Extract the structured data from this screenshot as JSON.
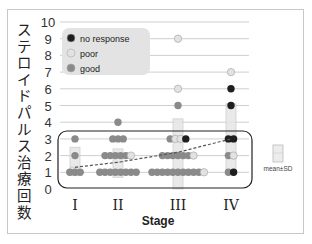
{
  "chart_data": {
    "type": "scatter",
    "title": "",
    "xlabel": "Stage",
    "ylabel": "ステロイドパルス治療回数",
    "categories": [
      "I",
      "II",
      "III",
      "IV"
    ],
    "ylim": [
      0,
      10
    ],
    "yticks": [
      0,
      1,
      2,
      3,
      4,
      5,
      6,
      7,
      8,
      9,
      10
    ],
    "grid": true,
    "legend": {
      "position": "upper-left",
      "entries": [
        {
          "label": "no response",
          "color": "#1e1e1e"
        },
        {
          "label": "poor",
          "color": "#e2e2e2"
        },
        {
          "label": "good",
          "color": "#8a8a8a"
        }
      ]
    },
    "secondary_legend": {
      "label": "mean±SD",
      "symbol": "light box"
    },
    "series": [
      {
        "name": "good",
        "points": [
          {
            "stage": "I",
            "y": 3
          },
          {
            "stage": "I",
            "y": 2
          },
          {
            "stage": "I",
            "y": 1
          },
          {
            "stage": "I",
            "y": 1
          },
          {
            "stage": "I",
            "y": 1
          },
          {
            "stage": "II",
            "y": 4
          },
          {
            "stage": "II",
            "y": 3
          },
          {
            "stage": "II",
            "y": 3
          },
          {
            "stage": "II",
            "y": 3
          },
          {
            "stage": "II",
            "y": 2
          },
          {
            "stage": "II",
            "y": 2
          },
          {
            "stage": "II",
            "y": 2
          },
          {
            "stage": "II",
            "y": 2
          },
          {
            "stage": "II",
            "y": 2
          },
          {
            "stage": "II",
            "y": 1
          },
          {
            "stage": "II",
            "y": 1
          },
          {
            "stage": "II",
            "y": 1
          },
          {
            "stage": "II",
            "y": 1
          },
          {
            "stage": "II",
            "y": 1
          },
          {
            "stage": "II",
            "y": 1
          },
          {
            "stage": "II",
            "y": 1
          },
          {
            "stage": "II",
            "y": 1
          },
          {
            "stage": "III",
            "y": 5
          },
          {
            "stage": "III",
            "y": 3
          },
          {
            "stage": "III",
            "y": 2
          },
          {
            "stage": "III",
            "y": 2
          },
          {
            "stage": "III",
            "y": 2
          },
          {
            "stage": "III",
            "y": 2
          },
          {
            "stage": "III",
            "y": 2
          },
          {
            "stage": "III",
            "y": 2
          },
          {
            "stage": "III",
            "y": 1
          },
          {
            "stage": "III",
            "y": 1
          },
          {
            "stage": "III",
            "y": 1
          },
          {
            "stage": "III",
            "y": 1
          },
          {
            "stage": "III",
            "y": 1
          },
          {
            "stage": "III",
            "y": 1
          },
          {
            "stage": "III",
            "y": 1
          },
          {
            "stage": "III",
            "y": 1
          },
          {
            "stage": "III",
            "y": 1
          },
          {
            "stage": "III",
            "y": 1
          },
          {
            "stage": "IV",
            "y": 2
          },
          {
            "stage": "IV",
            "y": 1
          }
        ]
      },
      {
        "name": "poor",
        "points": [
          {
            "stage": "III",
            "y": 9
          },
          {
            "stage": "III",
            "y": 6
          },
          {
            "stage": "III",
            "y": 3
          },
          {
            "stage": "III",
            "y": 3
          },
          {
            "stage": "III",
            "y": 2
          },
          {
            "stage": "III",
            "y": 1
          },
          {
            "stage": "II",
            "y": 2
          },
          {
            "stage": "IV",
            "y": 7
          },
          {
            "stage": "IV",
            "y": 2
          }
        ]
      },
      {
        "name": "no response",
        "points": [
          {
            "stage": "III",
            "y": 3
          },
          {
            "stage": "IV",
            "y": 6
          },
          {
            "stage": "IV",
            "y": 5
          },
          {
            "stage": "IV",
            "y": 3
          },
          {
            "stage": "IV",
            "y": 3
          },
          {
            "stage": "IV",
            "y": 1
          }
        ]
      }
    ],
    "mean_sd": [
      {
        "stage": "I",
        "mean": 1.3,
        "low": 0.8,
        "high": 2.5
      },
      {
        "stage": "II",
        "mean": 1.6,
        "low": 0.7,
        "high": 2.4
      },
      {
        "stage": "III",
        "mean": 2.2,
        "low": 0.0,
        "high": 4.2
      },
      {
        "stage": "IV",
        "mean": 3.0,
        "low": 1.0,
        "high": 5.1
      }
    ],
    "annotations": [
      "rounded box enclosing y range 0.1–3.5 across all stages",
      "dashed line connecting stage means"
    ]
  }
}
